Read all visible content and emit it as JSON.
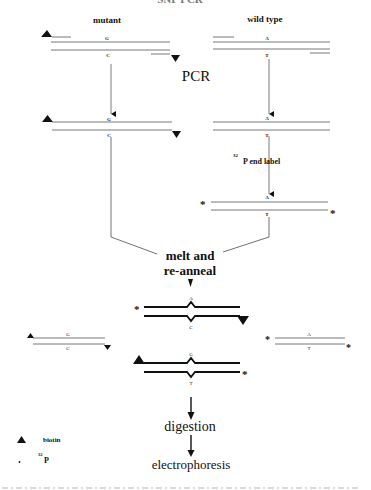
{
  "figure": {
    "top_fragment": "SNP PCR",
    "columns": {
      "mutant_label": "mutant",
      "wildtype_label": "wild type"
    },
    "steps": {
      "pcr": "PCR",
      "end_label_superscript": "32",
      "end_label_text": "P end label",
      "melt_line1": "melt and",
      "melt_line2": "re-anneal",
      "digestion": "digestion",
      "electrophoresis": "electrophoresis"
    },
    "bases": {
      "mutant_top": "G",
      "mutant_bottom": "C",
      "wildtype_top": "A",
      "wildtype_bottom": "T",
      "hetero1_top": "A",
      "hetero1_bottom": "C",
      "hetero2_top": "G",
      "hetero2_bottom": "T"
    },
    "legend": {
      "biotin_label": "biotin",
      "p32_superscript": "32",
      "p32_label": "P"
    },
    "markers": {
      "biotin_icon": "filled-triangle",
      "label_icon": "asterisk",
      "asterisk": "*"
    },
    "colors": {
      "ink": "#111111",
      "thin_line": "#555555",
      "background": "#ffffff"
    }
  }
}
